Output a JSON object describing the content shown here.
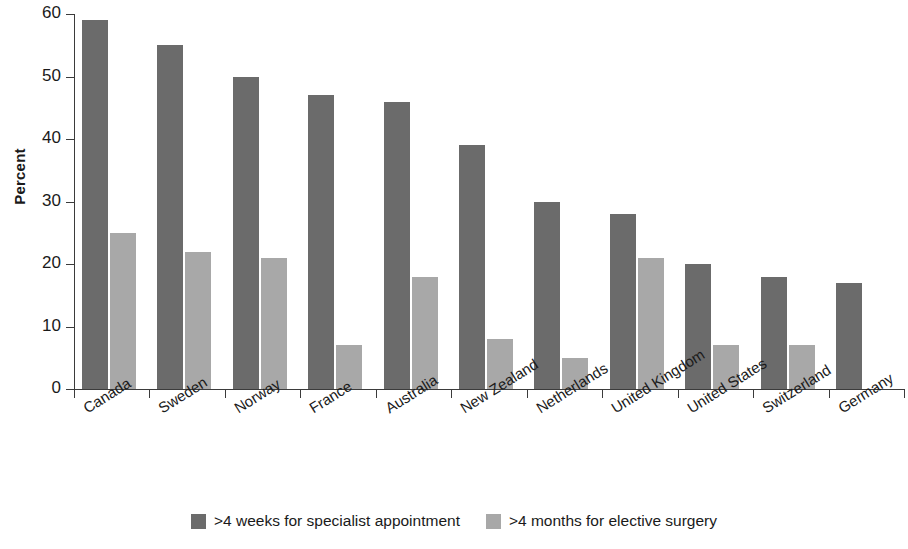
{
  "chart_data": {
    "type": "bar",
    "title": "",
    "xlabel": "",
    "ylabel": "Percent",
    "ylim": [
      0,
      60
    ],
    "yticks": [
      0,
      10,
      20,
      30,
      40,
      50,
      60
    ],
    "grid": false,
    "legend_position": "bottom-center",
    "categories": [
      "Canada",
      "Sweden",
      "Norway",
      "France",
      "Australia",
      "New Zealand",
      "Netherlands",
      "United Kingdom",
      "United States",
      "Switzerland",
      "Germany"
    ],
    "series": [
      {
        "name": ">4 weeks for specialist appointment",
        "color": "#6b6b6b",
        "values": [
          59,
          55,
          50,
          47,
          46,
          39,
          30,
          28,
          20,
          18,
          17
        ]
      },
      {
        "name": ">4 months for elective surgery",
        "color": "#a8a8a8",
        "values": [
          25,
          22,
          21,
          7,
          18,
          8,
          5,
          21,
          7,
          7,
          null
        ]
      }
    ]
  },
  "axis": {
    "y_title": "Percent"
  },
  "legend": {
    "items": [
      {
        "label": ">4 weeks for specialist appointment",
        "swatch": "primary"
      },
      {
        "label": ">4 months for elective surgery",
        "swatch": "secondary"
      }
    ]
  }
}
